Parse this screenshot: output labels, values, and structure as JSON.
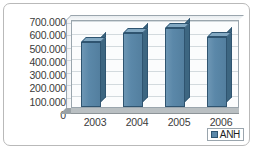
{
  "chart_data": {
    "type": "bar",
    "title": "",
    "subtitle": "",
    "xlabel": "",
    "ylabel": "",
    "categories": [
      "2003",
      "2004",
      "2005",
      "2006"
    ],
    "series": [
      {
        "name": "ANH",
        "values": [
          520000,
          590000,
          630000,
          555000
        ]
      }
    ],
    "ytick_labels": [
      "700.000",
      "600.000",
      "500.000",
      "400.000",
      "300.000",
      "200.000",
      "100.000",
      "0"
    ],
    "ytick_values": [
      700000,
      600000,
      500000,
      400000,
      300000,
      200000,
      100000,
      0
    ],
    "ylim": [
      0,
      700000
    ],
    "grid": true,
    "legend_position": "bottom-right",
    "three_d": true,
    "colors": {
      "bar_face": "#5b88a9",
      "bar_side": "#3d6681",
      "bar_top": "#82a8c2",
      "bar_outline": "#2f5470",
      "plot_background": "#fbfcfd",
      "gridline": "#d3dade",
      "axis_line": "#9aa5ad",
      "floor": "#b9bfc2",
      "text": "#3b3b3b",
      "card_border": "#b9b9b9",
      "card_background": "#ffffff"
    }
  },
  "legend": {
    "entries": [
      {
        "label": "ANH",
        "swatch_color": "#5b88a9",
        "icon": "legend-swatch-icon"
      }
    ]
  }
}
